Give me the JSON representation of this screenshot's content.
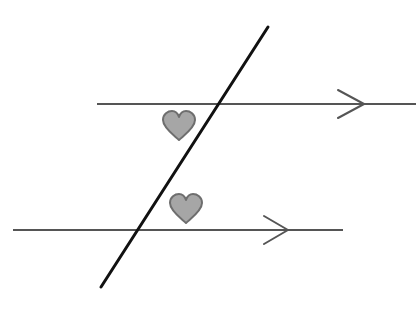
{
  "diagram": {
    "colors": {
      "background": "#ffffff",
      "parallel_line": "#555555",
      "transversal": "#111111",
      "heart_fill": "#a6a6a6",
      "heart_stroke": "#6e6e6e"
    },
    "parallel_lines": [
      {
        "name": "top",
        "x1": 97,
        "y1": 104,
        "x2": 416,
        "y2": 104,
        "arrow_tip": [
          365,
          104
        ]
      },
      {
        "name": "bottom",
        "x1": 13,
        "y1": 230,
        "x2": 343,
        "y2": 230,
        "arrow_tip": [
          290,
          230
        ]
      }
    ],
    "transversal": {
      "x1": 268,
      "y1": 27,
      "x2": 101,
      "y2": 287
    },
    "angle_markers": [
      {
        "shape": "heart-icon",
        "cx": 179,
        "cy": 125
      },
      {
        "shape": "heart-icon",
        "cx": 186,
        "cy": 208
      }
    ]
  }
}
